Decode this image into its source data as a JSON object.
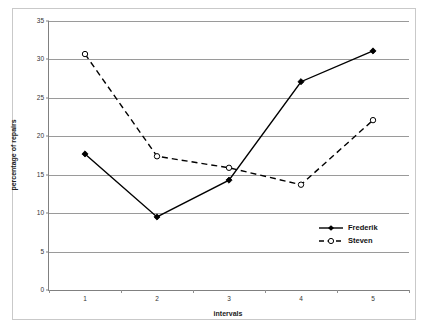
{
  "chart_data": {
    "type": "line",
    "title": "",
    "xlabel": "intervals",
    "ylabel": "percentage of repairs",
    "categories": [
      "1",
      "2",
      "3",
      "4",
      "5"
    ],
    "series": [
      {
        "name": "Frederik",
        "values": [
          17.7,
          9.5,
          14.3,
          27.1,
          31.1
        ],
        "line_style": "solid",
        "marker": "filled-diamond",
        "color": "#000000"
      },
      {
        "name": "Steven",
        "values": [
          30.7,
          17.4,
          15.9,
          13.7,
          22.1
        ],
        "line_style": "dashed",
        "marker": "open-circle",
        "color": "#000000"
      }
    ],
    "ylim": [
      0,
      35
    ],
    "ytick_values": [
      0,
      5,
      10,
      15,
      20,
      25,
      30,
      35
    ],
    "ytick_labels": [
      "0",
      "5",
      "10",
      "15",
      "20",
      "25",
      "30",
      "35"
    ],
    "grid": "horizontal",
    "legend_position": "inside-right",
    "axis_color": "#808080",
    "grid_color": "#9a9a9a"
  },
  "legend": {
    "items": [
      {
        "label": "Frederik"
      },
      {
        "label": "Steven"
      }
    ]
  }
}
